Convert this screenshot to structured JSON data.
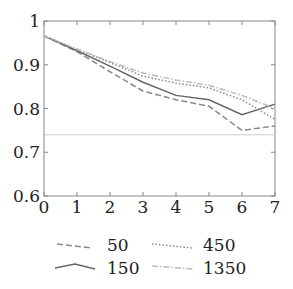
{
  "chart_data": {
    "type": "line",
    "title": "",
    "xlabel": "",
    "ylabel": "",
    "xlim": [
      0,
      7
    ],
    "ylim": [
      0.6,
      1.0
    ],
    "x": [
      0,
      1,
      2,
      3,
      4,
      5,
      6,
      7
    ],
    "x_ticks": [
      "0",
      "1",
      "2",
      "3",
      "4",
      "5",
      "6",
      "7"
    ],
    "y_ticks": [
      "0.6",
      "0.7",
      "0.8",
      "0.9",
      "1"
    ],
    "y_tick_values": [
      0.6,
      0.7,
      0.8,
      0.9,
      1.0
    ],
    "grid": false,
    "legend_position": "bottom",
    "series": [
      {
        "name": "50",
        "style": "dashed",
        "color": "#888888",
        "values": [
          0.966,
          0.93,
          0.884,
          0.84,
          0.82,
          0.805,
          0.75,
          0.76
        ]
      },
      {
        "name": "150",
        "style": "solid",
        "color": "#666666",
        "values": [
          0.966,
          0.932,
          0.897,
          0.86,
          0.83,
          0.82,
          0.786,
          0.81
        ]
      },
      {
        "name": "450",
        "style": "dotted",
        "color": "#888888",
        "values": [
          0.966,
          0.935,
          0.905,
          0.874,
          0.858,
          0.847,
          0.82,
          0.775
        ]
      },
      {
        "name": "1350",
        "style": "dashdot",
        "color": "#bbbbbb",
        "values": [
          0.966,
          0.936,
          0.907,
          0.881,
          0.865,
          0.853,
          0.83,
          0.8
        ]
      }
    ],
    "reference_line": {
      "y": 0.74,
      "color": "#cccccc"
    }
  },
  "legend": {
    "items": [
      {
        "label": "50"
      },
      {
        "label": "450"
      },
      {
        "label": "150"
      },
      {
        "label": "1350"
      }
    ]
  }
}
